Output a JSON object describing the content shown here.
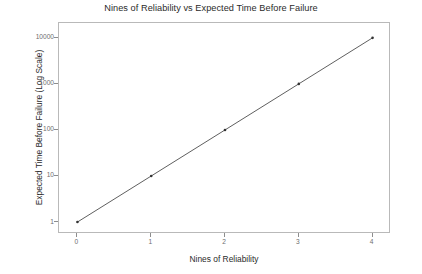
{
  "chart_data": {
    "type": "line",
    "title": "Nines of Reliability vs Expected Time Before Failure",
    "xlabel": "Nines of Reliability",
    "ylabel": "Expected Time Before Failure (Log Scale)",
    "x": [
      0,
      1,
      2,
      3,
      4
    ],
    "values": [
      1,
      10,
      100,
      1000,
      10000
    ],
    "series": [
      {
        "name": "Expected Time Before Failure",
        "values": [
          1,
          10,
          100,
          1000,
          10000
        ]
      }
    ],
    "xlim": [
      -0.25,
      4.25
    ],
    "ylim": [
      0.55,
      21000
    ],
    "yscale": "log",
    "xscale": "linear",
    "xticks": [
      "0",
      "1",
      "2",
      "3",
      "4"
    ],
    "yticks": [
      "1",
      "10",
      "100",
      "1000",
      "10000"
    ],
    "grid": false,
    "legend": false,
    "legend_position": "none",
    "marker": "point",
    "line_color": "#4d4d4d",
    "marker_color": "#333333",
    "panel_border_color": "#b9b9b9",
    "background_color": "#ffffff",
    "tick_label_color": "#6e6e6e"
  },
  "axes": {
    "y_ticks": [
      {
        "label": "10000",
        "value": 10000
      },
      {
        "label": "1000",
        "value": 1000
      },
      {
        "label": "100",
        "value": 100
      },
      {
        "label": "10",
        "value": 10
      },
      {
        "label": "1",
        "value": 1
      }
    ],
    "x_ticks": [
      {
        "label": "0",
        "value": 0
      },
      {
        "label": "1",
        "value": 1
      },
      {
        "label": "2",
        "value": 2
      },
      {
        "label": "3",
        "value": 3
      },
      {
        "label": "4",
        "value": 4
      }
    ]
  }
}
